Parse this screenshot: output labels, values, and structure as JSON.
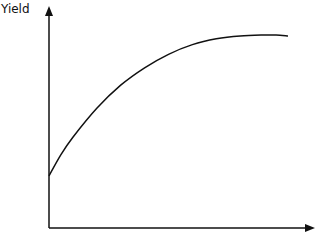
{
  "chart_data": {
    "type": "line",
    "title": "",
    "xlabel": "",
    "ylabel": "Yield",
    "grid": false,
    "legend": null,
    "ticks": false,
    "series": [
      {
        "name": "Yield",
        "x": [
          0,
          0.05,
          0.1,
          0.2,
          0.3,
          0.4,
          0.5,
          0.6,
          0.7,
          0.8,
          0.9,
          0.95,
          1.0
        ],
        "y": [
          0.27,
          0.38,
          0.47,
          0.62,
          0.74,
          0.83,
          0.9,
          0.95,
          0.98,
          0.995,
          1.0,
          1.0,
          0.995
        ]
      }
    ]
  },
  "axes": {
    "ylabel": "Yield"
  },
  "colors": {
    "line": "#111111",
    "axis": "#111111"
  }
}
